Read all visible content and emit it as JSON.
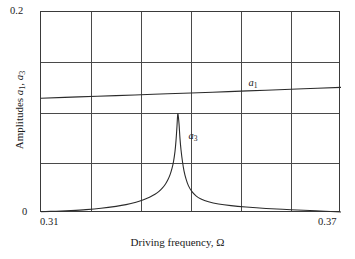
{
  "chart_data": {
    "type": "line",
    "title": "",
    "subtitle": "",
    "xlabel": "Driving frequency, Ω",
    "ylabel": "Amplitudes a₁, a₃",
    "xlim": [
      0.31,
      0.37
    ],
    "ylim": [
      0.0,
      0.2
    ],
    "xticks": [
      0.31,
      0.37
    ],
    "xticklabels": [
      "0.31",
      "0.37"
    ],
    "yticks": [
      0.0,
      0.2
    ],
    "yticklabels": [
      "0",
      "0.2"
    ],
    "grid": true,
    "grid_x_divisions": 6,
    "grid_y_divisions": 4,
    "grid_x_values": [
      0.31,
      0.32,
      0.33,
      0.34,
      0.35,
      0.36,
      0.37
    ],
    "grid_y_values": [
      0.0,
      0.05,
      0.1,
      0.15,
      0.2
    ],
    "legend": "none",
    "annotations": [
      {
        "text": "a₁",
        "x": 0.3515,
        "y": 0.1285,
        "name": "a1-curve-label"
      },
      {
        "text": "a₃",
        "x": 0.3395,
        "y": 0.0755,
        "name": "a3-curve-label"
      }
    ],
    "series": [
      {
        "name": "a₁",
        "label": "a₁",
        "color": "#2b2b2b",
        "x": [
          0.31,
          0.3175,
          0.325,
          0.3325,
          0.34,
          0.3475,
          0.355,
          0.3625,
          0.37
        ],
        "y": [
          0.1142,
          0.1155,
          0.1168,
          0.1181,
          0.1194,
          0.1208,
          0.1222,
          0.1236,
          0.125
        ]
      },
      {
        "name": "a₃",
        "label": "a₃",
        "color": "#2b2b2b",
        "x": [
          0.31,
          0.313,
          0.316,
          0.319,
          0.322,
          0.325,
          0.327,
          0.329,
          0.3305,
          0.3318,
          0.3328,
          0.3336,
          0.3343,
          0.3349,
          0.3354,
          0.3358,
          0.3362,
          0.3365,
          0.3368,
          0.337,
          0.3372,
          0.3373,
          0.3374,
          0.3376,
          0.3378,
          0.338,
          0.3383,
          0.3386,
          0.339,
          0.3395,
          0.3402,
          0.341,
          0.342,
          0.3435,
          0.3455,
          0.348,
          0.351,
          0.355,
          0.36,
          0.365,
          0.37
        ],
        "y": [
          0.0013,
          0.0018,
          0.0025,
          0.0034,
          0.0047,
          0.0066,
          0.0083,
          0.0107,
          0.0131,
          0.0159,
          0.0186,
          0.0215,
          0.0249,
          0.0289,
          0.0333,
          0.0379,
          0.0443,
          0.0511,
          0.0613,
          0.072,
          0.0865,
          0.0955,
          0.0985,
          0.089,
          0.074,
          0.063,
          0.051,
          0.042,
          0.034,
          0.027,
          0.0212,
          0.017,
          0.0139,
          0.0112,
          0.009,
          0.0073,
          0.0059,
          0.0045,
          0.0033,
          0.0022,
          0.001
        ]
      }
    ]
  },
  "axes": {
    "y_tick_top": "0.2",
    "y_tick_bottom": "0",
    "x_tick_left": "0.31",
    "x_tick_right": "0.37",
    "x_title": "Driving frequency, Ω",
    "y_title_prefix": "Amplitudes ",
    "y_title": "Amplitudes a1, a3"
  },
  "annotations": {
    "a1_label": "a1",
    "a3_label": "a3"
  },
  "colors": {
    "curve": "#2b2b2b",
    "grid": "#4a4a4a",
    "frame": "#3a3a3a",
    "text": "#1a1a1a",
    "background": "#ffffff"
  }
}
